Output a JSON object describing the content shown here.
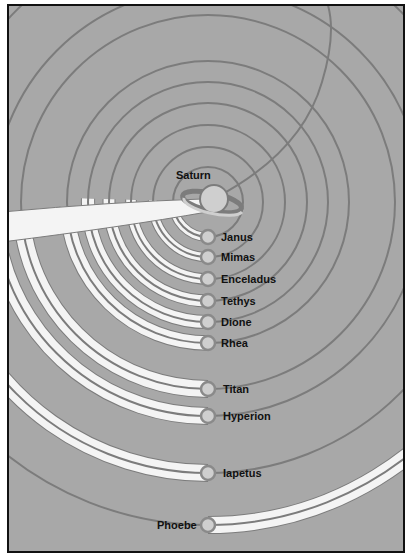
{
  "diagram": {
    "colors": {
      "background": "#a8a8a8",
      "orbit_line": "#7c7c7c",
      "trail": "#f4f4f4",
      "moon_fill": "#cfcfcf",
      "moon_outline": "#8a8a8a",
      "border": "#111111"
    },
    "center": {
      "x": 206,
      "y": 200
    },
    "planet": {
      "label": "Saturn",
      "x": 210,
      "y": 200
    },
    "moons": [
      {
        "name": "Janus",
        "radius": 35,
        "y": 235,
        "trail": "left"
      },
      {
        "name": "Mimas",
        "radius": 55,
        "y": 255,
        "trail": "left"
      },
      {
        "name": "Enceladus",
        "radius": 77,
        "y": 277,
        "trail": "left"
      },
      {
        "name": "Tethys",
        "radius": 99,
        "y": 299,
        "trail": "left"
      },
      {
        "name": "Dione",
        "radius": 120,
        "y": 320,
        "trail": "left"
      },
      {
        "name": "Rhea",
        "radius": 141,
        "y": 341,
        "trail": "left"
      },
      {
        "name": "Titan",
        "radius": 187,
        "y": 387,
        "trail": "left"
      },
      {
        "name": "Hyperion",
        "radius": 214,
        "y": 414,
        "trail": "left"
      },
      {
        "name": "Iapetus",
        "radius": 271,
        "y": 471,
        "trail": "left"
      },
      {
        "name": "Phoebe",
        "radius": 323,
        "y": 523,
        "trail": "right"
      }
    ]
  }
}
